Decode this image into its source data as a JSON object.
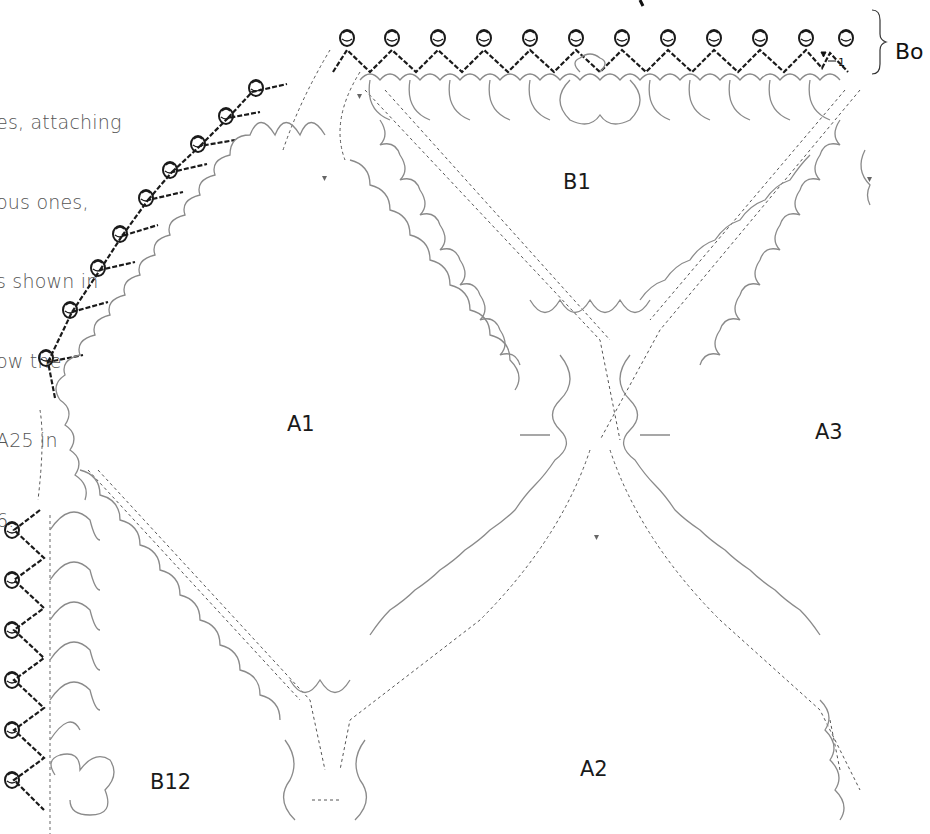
{
  "intro_text": {
    "lines": [
      "es, attaching",
      "ous ones,",
      "s shown in",
      "ow the",
      "​A25 in",
      "6."
    ]
  },
  "labels": {
    "border": "Bo",
    "border_marker": "1",
    "motifs": [
      {
        "id": "B1",
        "x": 563,
        "y": 170
      },
      {
        "id": "A1",
        "x": 285,
        "y": 412
      },
      {
        "id": "A3",
        "x": 815,
        "y": 420
      },
      {
        "id": "B12",
        "x": 150,
        "y": 770
      },
      {
        "id": "A2",
        "x": 580,
        "y": 757
      }
    ]
  },
  "colors": {
    "border_stitches": "#1a1a1a",
    "motif_stitches": "#8a8a8a",
    "join_dashes": "#555555",
    "text": "#555555"
  }
}
